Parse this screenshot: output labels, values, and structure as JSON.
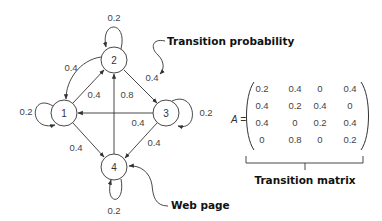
{
  "diagram": {
    "type": "markov-chain-graph",
    "nodes": [
      {
        "id": "1",
        "label": "1",
        "cx": 64,
        "cy": 113
      },
      {
        "id": "2",
        "label": "2",
        "cx": 114,
        "cy": 60
      },
      {
        "id": "3",
        "label": "3",
        "cx": 166,
        "cy": 113
      },
      {
        "id": "4",
        "label": "4",
        "cx": 114,
        "cy": 167
      }
    ],
    "edges": [
      {
        "from": "1",
        "to": "1",
        "weight": "0.2"
      },
      {
        "from": "1",
        "to": "2",
        "weight": "0.4"
      },
      {
        "from": "1",
        "to": "4",
        "weight": "0.4"
      },
      {
        "from": "2",
        "to": "1",
        "weight": "0.4"
      },
      {
        "from": "2",
        "to": "2",
        "weight": "0.2"
      },
      {
        "from": "2",
        "to": "3",
        "weight": "0.4"
      },
      {
        "from": "3",
        "to": "1",
        "weight": "0.4"
      },
      {
        "from": "3",
        "to": "3",
        "weight": "0.2"
      },
      {
        "from": "3",
        "to": "4",
        "weight": "0.4"
      },
      {
        "from": "4",
        "to": "2",
        "weight": "0.8"
      },
      {
        "from": "4",
        "to": "4",
        "weight": "0.2"
      }
    ],
    "edge_labels": {
      "self_2": "0.2",
      "e21": "0.4",
      "e12": "0.4",
      "e42": "0.8",
      "e23": "0.4",
      "self_1": "0.2",
      "e31": "0.4",
      "self_3": "0.2",
      "e14": "0.4",
      "e34": "0.4",
      "self_4": "0.2"
    },
    "callouts": {
      "transition_probability": "Transition probability",
      "web_page": "Web page",
      "transition_matrix": "Transition matrix"
    }
  },
  "matrix": {
    "name": "A =",
    "rows": [
      [
        "0.2",
        "0.4",
        "0",
        "0.4"
      ],
      [
        "0.4",
        "0.2",
        "0.4",
        "0"
      ],
      [
        "0.4",
        "0",
        "0.2",
        "0.4"
      ],
      [
        "0",
        "0.8",
        "0",
        "0.2"
      ]
    ]
  },
  "colors": {
    "stroke": "#333333",
    "text": "#444444",
    "callout_text": "#111111",
    "background": "#ffffff"
  }
}
